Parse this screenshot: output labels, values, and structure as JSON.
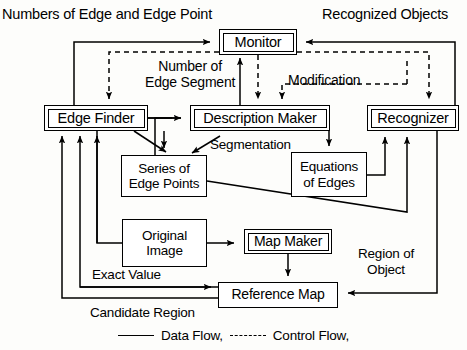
{
  "diagram": {
    "title": "Numbers of Edge and Edge Point",
    "nodes": [
      {
        "id": "monitor",
        "label": "Monitor",
        "style": "double",
        "x": 219,
        "y": 29,
        "w": 78,
        "h": 26,
        "font": 14.5
      },
      {
        "id": "edge-finder",
        "label": "Edge Finder",
        "style": "double",
        "x": 44,
        "y": 105,
        "w": 104,
        "h": 26,
        "font": 14.5
      },
      {
        "id": "description-maker",
        "label": "Description Maker",
        "style": "double",
        "x": 190,
        "y": 105,
        "w": 140,
        "h": 26,
        "font": 14.5
      },
      {
        "id": "recognizer",
        "label": "Recognizer",
        "style": "double",
        "x": 367,
        "y": 105,
        "w": 92,
        "h": 26,
        "font": 14.5
      },
      {
        "id": "series-edge-points",
        "label": "Series of\nEdge Points",
        "style": "single",
        "x": 121,
        "y": 155,
        "w": 86,
        "h": 42,
        "font": 13.5
      },
      {
        "id": "equations-edges",
        "label": "Equations\nof Edges",
        "style": "single",
        "x": 291,
        "y": 152,
        "w": 76,
        "h": 45,
        "font": 13.5
      },
      {
        "id": "original-image",
        "label": "Original\nImage",
        "style": "single",
        "x": 122,
        "y": 219,
        "w": 85,
        "h": 48,
        "font": 13.5
      },
      {
        "id": "map-maker",
        "label": "Map Maker",
        "style": "double",
        "x": 244,
        "y": 229,
        "w": 88,
        "h": 25,
        "font": 14.0
      },
      {
        "id": "reference-map",
        "label": "Reference Map",
        "style": "single",
        "x": 218,
        "y": 282,
        "w": 120,
        "h": 26,
        "font": 14.0
      }
    ],
    "free_labels": [
      {
        "id": "numbers-of-edge",
        "text": "Numbers of Edge and Edge Point",
        "x": 2,
        "y": 6,
        "font": 14.5,
        "align": "left"
      },
      {
        "id": "recognized-objects",
        "text": "Recognized Objects",
        "x": 322,
        "y": 6,
        "font": 14.5,
        "align": "left"
      },
      {
        "id": "number-of-edge-segment",
        "text": "Number of\nEdge Segment",
        "x": 145,
        "y": 58,
        "font": 14.0,
        "align": "center"
      },
      {
        "id": "modification",
        "text": "Modification",
        "x": 288,
        "y": 72,
        "font": 14.0,
        "align": "left"
      },
      {
        "id": "segmentation",
        "text": "Segmentation",
        "x": 210,
        "y": 137,
        "font": 13.5,
        "align": "left"
      },
      {
        "id": "region-of-object",
        "text": "Region of\nObject",
        "x": 358,
        "y": 246,
        "font": 13.5,
        "align": "center"
      },
      {
        "id": "exact-value",
        "text": "Exact Value",
        "x": 92,
        "y": 267,
        "font": 13.5,
        "align": "left"
      },
      {
        "id": "candidate-region",
        "text": "Candidate Region",
        "x": 90,
        "y": 305,
        "font": 13.5,
        "align": "left"
      }
    ],
    "legend": {
      "data_flow_label": "Data Flow,",
      "control_flow_label": "Control Flow,"
    },
    "colors": {
      "line": "#000000",
      "background": "#ffffff",
      "text": "#000000"
    }
  }
}
